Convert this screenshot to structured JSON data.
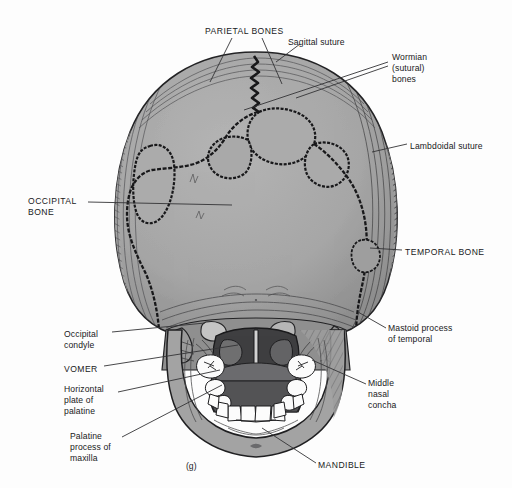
{
  "figure": {
    "caption": "(g)",
    "view": "posterior view of the skull",
    "background_color": "#fdfdfd",
    "line_color": "#2b2b2d",
    "bone_fill": "#a8a8a8",
    "bone_fill_dark": "#7d7d7d",
    "cavity_dark": "#4a4a4c",
    "tooth_fill": "#fbfbfb"
  },
  "labels": [
    {
      "id": "parietal-bones",
      "text": "PARIETAL BONES",
      "style": "caps",
      "x": 205,
      "y": 26,
      "align": "left"
    },
    {
      "id": "sagittal-suture",
      "text": "Sagittal suture",
      "style": "sentence",
      "x": 288,
      "y": 37,
      "align": "left"
    },
    {
      "id": "wormian-sutural-bones",
      "text": "Wormian\n(sutural)\nbones",
      "style": "sentence",
      "x": 392,
      "y": 52,
      "align": "left"
    },
    {
      "id": "lambdoidal-suture",
      "text": "Lambdoidal suture",
      "style": "sentence",
      "x": 410,
      "y": 141,
      "align": "left"
    },
    {
      "id": "occipital-bone",
      "text": "OCCIPITAL\nBONE",
      "style": "caps",
      "x": 28,
      "y": 196,
      "align": "left"
    },
    {
      "id": "temporal-bone",
      "text": "TEMPORAL BONE",
      "style": "caps",
      "x": 405,
      "y": 247,
      "align": "left"
    },
    {
      "id": "occipital-condyle",
      "text": "Occipital\ncondyle",
      "style": "sentence",
      "x": 64,
      "y": 329,
      "align": "left"
    },
    {
      "id": "mastoid-process-of-temporal",
      "text": "Mastoid process\nof temporal",
      "style": "sentence",
      "x": 388,
      "y": 323,
      "align": "left"
    },
    {
      "id": "vomer",
      "text": "VOMER",
      "style": "caps",
      "x": 64,
      "y": 364,
      "align": "left"
    },
    {
      "id": "horizontal-plate-of-palatine",
      "text": "Horizontal\nplate of\npalatine",
      "style": "sentence",
      "x": 64,
      "y": 384,
      "align": "left"
    },
    {
      "id": "middle-nasal-concha",
      "text": "Middle\nnasal\nconcha",
      "style": "sentence",
      "x": 368,
      "y": 378,
      "align": "left"
    },
    {
      "id": "palatine-process-of-maxilla",
      "text": "Palatine\nprocess of\nmaxilla",
      "style": "sentence",
      "x": 70,
      "y": 431,
      "align": "left"
    },
    {
      "id": "mandible",
      "text": "MANDIBLE",
      "style": "caps",
      "x": 318,
      "y": 460,
      "align": "left"
    }
  ],
  "leader_lines": [
    {
      "id": "leader-parietal-left",
      "points": "232,38 210,82"
    },
    {
      "id": "leader-parietal-right",
      "points": "262,38 282,84"
    },
    {
      "id": "leader-sagittal",
      "points": "300,44 276,62"
    },
    {
      "id": "leader-wormian-a",
      "points": "388,62 244,110"
    },
    {
      "id": "leader-wormian-b",
      "points": "388,66 296,98"
    },
    {
      "id": "leader-lambdoidal",
      "points": "407,144 372,152"
    },
    {
      "id": "leader-occipital-bone",
      "points": "88,202 232,205"
    },
    {
      "id": "leader-temporal-bone",
      "points": "402,250 370,248"
    },
    {
      "id": "leader-occipital-condyle",
      "points": "112,332 205,323"
    },
    {
      "id": "leader-mastoid",
      "points": "386,328 358,312"
    },
    {
      "id": "leader-vomer",
      "points": "104,366 238,345"
    },
    {
      "id": "leader-horizontal-plate",
      "points": "118,392 220,370"
    },
    {
      "id": "leader-middle-concha",
      "points": "366,384 312,360"
    },
    {
      "id": "leader-palatine-process",
      "points": "122,437 222,385"
    },
    {
      "id": "leader-mandible",
      "points": "316,463 262,428"
    }
  ]
}
